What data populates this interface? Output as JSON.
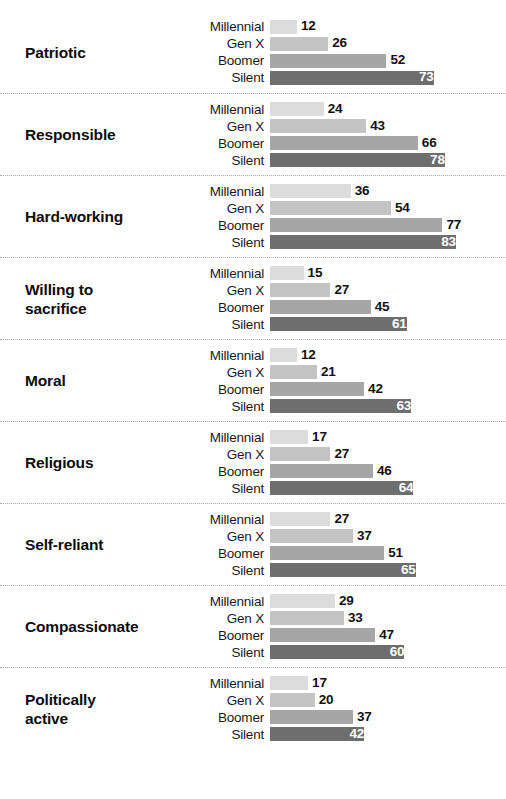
{
  "chart_data": {
    "type": "bar",
    "orientation": "horizontal",
    "title": "",
    "subtitle": "",
    "xlabel": "",
    "ylabel": "",
    "xlim": [
      0,
      100
    ],
    "grid": false,
    "legend_position": "none",
    "value_suffix": "",
    "categories": [
      "Patriotic",
      "Responsible",
      "Hard-working",
      "Willing to sacrifice",
      "Moral",
      "Religious",
      "Self-reliant",
      "Compassionate",
      "Politically active"
    ],
    "series": [
      {
        "name": "Millennial",
        "color": "#dcdcdc",
        "values": [
          12,
          24,
          36,
          15,
          12,
          17,
          27,
          29,
          17
        ]
      },
      {
        "name": "Gen X",
        "color": "#c4c4c4",
        "values": [
          26,
          43,
          54,
          27,
          21,
          27,
          37,
          33,
          20
        ]
      },
      {
        "name": "Boomer",
        "color": "#a6a6a6",
        "values": [
          52,
          66,
          77,
          45,
          42,
          46,
          51,
          47,
          37
        ]
      },
      {
        "name": "Silent",
        "color": "#6e6e6e",
        "values": [
          73,
          78,
          83,
          61,
          63,
          64,
          65,
          60,
          42
        ]
      }
    ]
  },
  "blocks": [
    {
      "label": "Patriotic",
      "label_lines": [
        "Patriotic"
      ],
      "rows": [
        {
          "gen": "Millennial",
          "value": "12",
          "num": 12,
          "color": "#dcdcdc",
          "inside": false
        },
        {
          "gen": "Gen X",
          "value": "26",
          "num": 26,
          "color": "#c4c4c4",
          "inside": false
        },
        {
          "gen": "Boomer",
          "value": "52",
          "num": 52,
          "color": "#a6a6a6",
          "inside": false
        },
        {
          "gen": "Silent",
          "value": "73",
          "num": 73,
          "color": "#6e6e6e",
          "inside": true
        }
      ]
    },
    {
      "label": "Responsible",
      "label_lines": [
        "Responsible"
      ],
      "rows": [
        {
          "gen": "Millennial",
          "value": "24",
          "num": 24,
          "color": "#dcdcdc",
          "inside": false
        },
        {
          "gen": "Gen X",
          "value": "43",
          "num": 43,
          "color": "#c4c4c4",
          "inside": false
        },
        {
          "gen": "Boomer",
          "value": "66",
          "num": 66,
          "color": "#a6a6a6",
          "inside": false
        },
        {
          "gen": "Silent",
          "value": "78",
          "num": 78,
          "color": "#6e6e6e",
          "inside": true
        }
      ]
    },
    {
      "label": "Hard-working",
      "label_lines": [
        "Hard-working"
      ],
      "rows": [
        {
          "gen": "Millennial",
          "value": "36",
          "num": 36,
          "color": "#dcdcdc",
          "inside": false
        },
        {
          "gen": "Gen X",
          "value": "54",
          "num": 54,
          "color": "#c4c4c4",
          "inside": false
        },
        {
          "gen": "Boomer",
          "value": "77",
          "num": 77,
          "color": "#a6a6a6",
          "inside": false
        },
        {
          "gen": "Silent",
          "value": "83",
          "num": 83,
          "color": "#6e6e6e",
          "inside": true
        }
      ]
    },
    {
      "label": "Willing to sacrifice",
      "label_lines": [
        "Willing to",
        "sacrifice"
      ],
      "rows": [
        {
          "gen": "Millennial",
          "value": "15",
          "num": 15,
          "color": "#dcdcdc",
          "inside": false
        },
        {
          "gen": "Gen X",
          "value": "27",
          "num": 27,
          "color": "#c4c4c4",
          "inside": false
        },
        {
          "gen": "Boomer",
          "value": "45",
          "num": 45,
          "color": "#a6a6a6",
          "inside": false
        },
        {
          "gen": "Silent",
          "value": "61",
          "num": 61,
          "color": "#6e6e6e",
          "inside": true
        }
      ]
    },
    {
      "label": "Moral",
      "label_lines": [
        "Moral"
      ],
      "rows": [
        {
          "gen": "Millennial",
          "value": "12",
          "num": 12,
          "color": "#dcdcdc",
          "inside": false
        },
        {
          "gen": "Gen X",
          "value": "21",
          "num": 21,
          "color": "#c4c4c4",
          "inside": false
        },
        {
          "gen": "Boomer",
          "value": "42",
          "num": 42,
          "color": "#a6a6a6",
          "inside": false
        },
        {
          "gen": "Silent",
          "value": "63",
          "num": 63,
          "color": "#6e6e6e",
          "inside": true
        }
      ]
    },
    {
      "label": "Religious",
      "label_lines": [
        "Religious"
      ],
      "rows": [
        {
          "gen": "Millennial",
          "value": "17",
          "num": 17,
          "color": "#dcdcdc",
          "inside": false
        },
        {
          "gen": "Gen X",
          "value": "27",
          "num": 27,
          "color": "#c4c4c4",
          "inside": false
        },
        {
          "gen": "Boomer",
          "value": "46",
          "num": 46,
          "color": "#a6a6a6",
          "inside": false
        },
        {
          "gen": "Silent",
          "value": "64",
          "num": 64,
          "color": "#6e6e6e",
          "inside": true
        }
      ]
    },
    {
      "label": "Self-reliant",
      "label_lines": [
        "Self-reliant"
      ],
      "rows": [
        {
          "gen": "Millennial",
          "value": "27",
          "num": 27,
          "color": "#dcdcdc",
          "inside": false
        },
        {
          "gen": "Gen X",
          "value": "37",
          "num": 37,
          "color": "#c4c4c4",
          "inside": false
        },
        {
          "gen": "Boomer",
          "value": "51",
          "num": 51,
          "color": "#a6a6a6",
          "inside": false
        },
        {
          "gen": "Silent",
          "value": "65",
          "num": 65,
          "color": "#6e6e6e",
          "inside": true
        }
      ]
    },
    {
      "label": "Compassionate",
      "label_lines": [
        "Compassionate"
      ],
      "rows": [
        {
          "gen": "Millennial",
          "value": "29",
          "num": 29,
          "color": "#dcdcdc",
          "inside": false
        },
        {
          "gen": "Gen X",
          "value": "33",
          "num": 33,
          "color": "#c4c4c4",
          "inside": false
        },
        {
          "gen": "Boomer",
          "value": "47",
          "num": 47,
          "color": "#a6a6a6",
          "inside": false
        },
        {
          "gen": "Silent",
          "value": "60",
          "num": 60,
          "color": "#6e6e6e",
          "inside": true
        }
      ]
    },
    {
      "label": "Politically active",
      "label_lines": [
        "Politically",
        "active"
      ],
      "rows": [
        {
          "gen": "Millennial",
          "value": "17",
          "num": 17,
          "color": "#dcdcdc",
          "inside": false
        },
        {
          "gen": "Gen X",
          "value": "20",
          "num": 20,
          "color": "#c4c4c4",
          "inside": false
        },
        {
          "gen": "Boomer",
          "value": "37",
          "num": 37,
          "color": "#a6a6a6",
          "inside": false
        },
        {
          "gen": "Silent",
          "value": "42",
          "num": 42,
          "color": "#6e6e6e",
          "inside": true
        }
      ]
    }
  ],
  "scale": {
    "px_per_unit": 2.24
  }
}
